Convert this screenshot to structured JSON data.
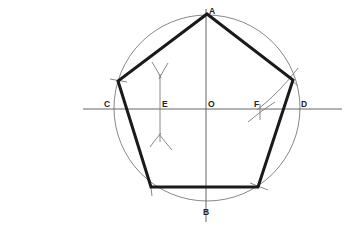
{
  "diagram": {
    "colors": {
      "pentagon": "#1a1a1a",
      "construction": "#7a7a7a",
      "axes": "#555555",
      "labels": "#222222",
      "background": "#ffffff"
    },
    "circle": {
      "center": "O",
      "cx": 207,
      "cy": 108,
      "r": 93
    },
    "points": [
      {
        "id": "A",
        "label": "A",
        "x": 207,
        "y": 14
      },
      {
        "id": "B",
        "label": "B",
        "x": 207,
        "y": 201
      },
      {
        "id": "C",
        "label": "C",
        "x": 114,
        "y": 108
      },
      {
        "id": "D",
        "label": "D",
        "x": 300,
        "y": 108
      },
      {
        "id": "E",
        "label": "E",
        "x": 160,
        "y": 108
      },
      {
        "id": "F",
        "label": "F",
        "x": 260,
        "y": 108
      },
      {
        "id": "O",
        "label": "O",
        "x": 207,
        "y": 108
      }
    ],
    "pentagon_vertices": [
      {
        "x": 207,
        "y": 14
      },
      {
        "x": 293,
        "y": 80
      },
      {
        "x": 258,
        "y": 187
      },
      {
        "x": 151,
        "y": 187
      },
      {
        "x": 118,
        "y": 81
      }
    ],
    "labels": {
      "A": "A",
      "B": "B",
      "C": "C",
      "D": "D",
      "E": "E",
      "F": "F",
      "O": "O"
    }
  }
}
